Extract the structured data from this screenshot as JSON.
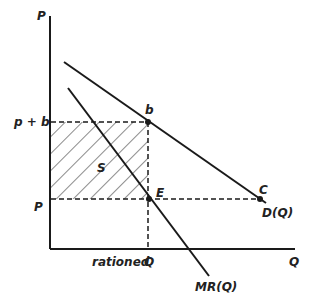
{
  "diagram": {
    "axes": {
      "y_label": "P",
      "x_label": "Q"
    },
    "price_levels": {
      "high": "p + b",
      "low": "P"
    },
    "quantity_label": {
      "prefix": "rationed",
      "symbol": "Q"
    },
    "points": {
      "b": "b",
      "E": "E",
      "C": "C"
    },
    "area_label": "S",
    "curves": {
      "demand": "D(Q)",
      "marginal_revenue": "MR(Q)"
    },
    "colors": {
      "line": "#1a1a1a",
      "background": "#ffffff"
    }
  }
}
